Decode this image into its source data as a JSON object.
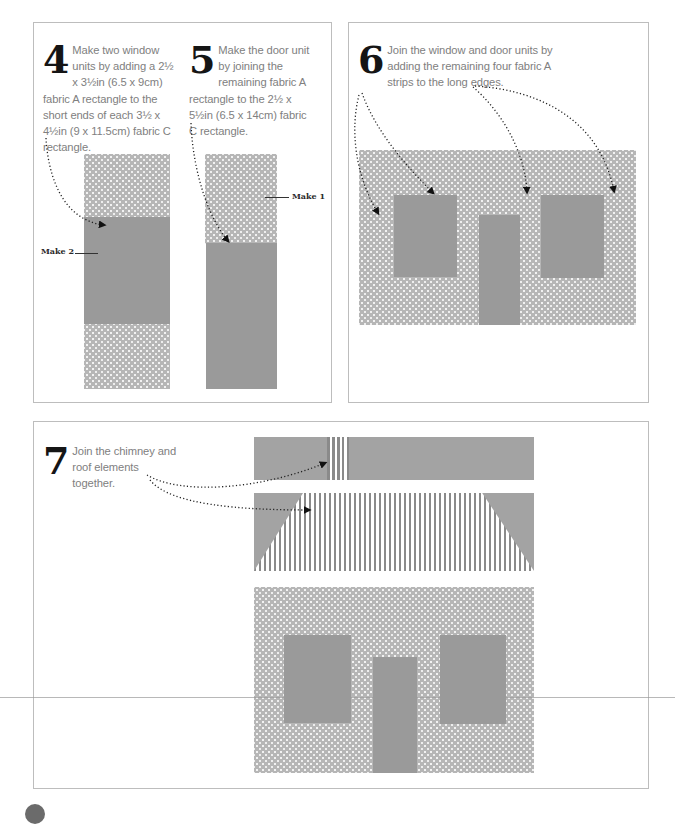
{
  "steps": [
    {
      "number": "4",
      "text": "Make two window units by adding a 2½ x 3½in (6.5 x 9cm) fabric A rectangle to the short ends of each 3½ x 4½in (9 x 11.5cm) fabric C rectangle.",
      "label": "Make 2"
    },
    {
      "number": "5",
      "text": "Make the door unit by joining the remaining fabric A rectangle to the 2½ x 5½in (6.5 x 14cm) fabric C rectangle.",
      "label": "Make 1"
    },
    {
      "number": "6",
      "text": "Join the window and door units by adding the remaining four fabric A strips to the long edges."
    },
    {
      "number": "7",
      "text": "Join the chimney and roof elements together."
    }
  ],
  "colors": {
    "fabric_a_dots": "#b6b6b6",
    "fabric_c_solid": "#9a9a9a",
    "stripe_dark": "#8a8a8a",
    "panel_border": "#bdbdbd",
    "step_number": "#151515",
    "body_text": "#808080"
  }
}
